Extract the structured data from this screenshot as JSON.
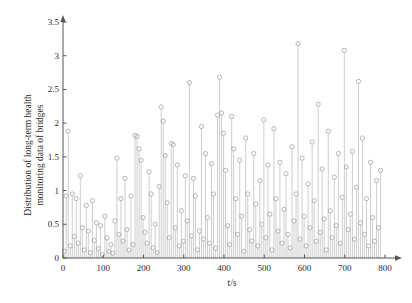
{
  "chart_data": {
    "type": "scatter",
    "subtype": "stem",
    "title": "",
    "xlabel": "t/s",
    "ylabel": "Distribution of long-term health monitoring data of bridges",
    "ylabel_line1": "Distribution of long-term health",
    "ylabel_line2": "monitoring data of bridges",
    "xlim": [
      0,
      800
    ],
    "ylim": [
      0,
      3.5
    ],
    "xticks": [
      0,
      100,
      200,
      300,
      400,
      500,
      600,
      700,
      800
    ],
    "xtick_labels": [
      "0",
      "100",
      "200",
      "300",
      "400",
      "500",
      "600",
      "700",
      "800"
    ],
    "yticks": [
      0,
      0.5,
      1,
      1.5,
      2,
      2.5,
      3,
      3.5
    ],
    "ytick_labels": [
      "0",
      "0.5",
      "1",
      "1.5",
      "2",
      "2.5",
      "3",
      "3.5"
    ],
    "grid": false,
    "legend": false,
    "marker": "open-circle",
    "marker_color": "#9d9d9d",
    "stem_color": "#b9b9b9",
    "axis_color": "#555555",
    "axis_arrows": true,
    "x": [
      3,
      8,
      13,
      18,
      23,
      28,
      33,
      38,
      43,
      48,
      53,
      58,
      63,
      68,
      73,
      78,
      83,
      88,
      93,
      98,
      104,
      109,
      114,
      119,
      124,
      129,
      134,
      139,
      144,
      149,
      154,
      159,
      164,
      169,
      174,
      179,
      184,
      189,
      194,
      199,
      204,
      209,
      214,
      219,
      224,
      229,
      234,
      239,
      244,
      249,
      254,
      259,
      264,
      269,
      274,
      279,
      284,
      289,
      294,
      299,
      304,
      309,
      314,
      319,
      324,
      329,
      334,
      339,
      344,
      349,
      354,
      359,
      364,
      369,
      374,
      379,
      384,
      389,
      394,
      399,
      404,
      409,
      414,
      419,
      424,
      429,
      434,
      439,
      444,
      449,
      454,
      459,
      464,
      469,
      474,
      479,
      484,
      489,
      494,
      499,
      504,
      509,
      514,
      519,
      524,
      529,
      534,
      539,
      544,
      549,
      554,
      559,
      564,
      569,
      574,
      579,
      584,
      589,
      594,
      599,
      604,
      609,
      614,
      619,
      624,
      629,
      634,
      639,
      644,
      649,
      654,
      659,
      664,
      669,
      674,
      679,
      684,
      689,
      694,
      699,
      704,
      709,
      714,
      719,
      724,
      729,
      734,
      739,
      744,
      749,
      754,
      759,
      764,
      769,
      774,
      779,
      784,
      789
    ],
    "y": [
      0.1,
      0.92,
      1.88,
      0.18,
      0.95,
      0.32,
      0.88,
      0.22,
      1.22,
      0.45,
      0.12,
      0.78,
      0.4,
      0.08,
      0.85,
      0.26,
      0.52,
      0.14,
      0.48,
      0.05,
      0.62,
      0.3,
      0.1,
      0.2,
      0.07,
      0.55,
      1.48,
      0.35,
      0.88,
      0.25,
      1.18,
      0.42,
      0.12,
      0.92,
      0.2,
      1.82,
      1.8,
      1.62,
      1.45,
      0.6,
      0.38,
      0.22,
      1.28,
      0.95,
      0.15,
      0.5,
      0.08,
      1.06,
      2.24,
      2.03,
      1.52,
      0.82,
      0.3,
      1.7,
      1.68,
      0.45,
      1.38,
      0.18,
      0.7,
      0.25,
      1.22,
      0.55,
      2.6,
      0.33,
      1.18,
      0.92,
      0.12,
      0.4,
      1.95,
      0.28,
      1.55,
      0.6,
      0.22,
      1.4,
      0.95,
      0.15,
      2.12,
      2.68,
      2.15,
      1.85,
      1.3,
      0.48,
      0.2,
      2.1,
      1.62,
      0.88,
      0.35,
      1.45,
      0.62,
      0.1,
      1.78,
      0.95,
      0.42,
      0.25,
      1.55,
      0.8,
      0.18,
      1.15,
      0.5,
      2.05,
      0.3,
      1.38,
      0.65,
      0.12,
      1.92,
      0.88,
      0.4,
      1.42,
      0.22,
      0.72,
      1.25,
      0.35,
      0.15,
      1.65,
      0.55,
      0.95,
      3.18,
      0.28,
      1.48,
      0.62,
      0.18,
      1.1,
      0.45,
      1.72,
      0.85,
      0.25,
      2.28,
      0.38,
      1.32,
      0.58,
      0.12,
      1.88,
      0.7,
      0.3,
      1.2,
      0.48,
      1.55,
      0.22,
      0.9,
      3.08,
      1.35,
      0.42,
      0.65,
      1.58,
      0.28,
      1.05,
      2.62,
      0.52,
      1.78,
      0.35,
      0.88,
      0.18,
      1.42,
      0.6,
      0.25,
      1.15,
      0.45,
      1.3,
      0.32,
      0.2
    ]
  }
}
